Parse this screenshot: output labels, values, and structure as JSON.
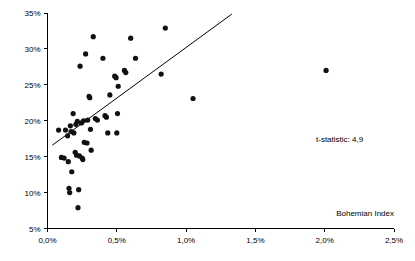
{
  "chart_data": {
    "type": "scatter",
    "title": "",
    "xlabel": "Bohemian Index",
    "ylabel": "",
    "xlim": [
      0.0,
      2.5
    ],
    "ylim": [
      5,
      35
    ],
    "grid": false,
    "legend": null,
    "x_tick_labels": [
      "0,0%",
      "0,5%",
      "1,0%",
      "1,5%",
      "2,0%",
      "2,5%"
    ],
    "x_tick_values": [
      0.0,
      0.5,
      1.0,
      1.5,
      2.0,
      2.5
    ],
    "y_tick_labels": [
      "5%",
      "10%",
      "15%",
      "20%",
      "25%",
      "30%",
      "35%"
    ],
    "y_tick_values": [
      5,
      10,
      15,
      20,
      25,
      30,
      35
    ],
    "annotations": [
      {
        "name": "t-statistic-annotation",
        "text": "t-statistic: 4,9",
        "x": 1.62,
        "y": 17.6
      }
    ],
    "trend_line": {
      "name": "regression-line",
      "x_start": 0.035,
      "y_start": 16.6,
      "x_end": 1.33,
      "y_end": 34.85
    },
    "point_radius_px": 2.6,
    "points": [
      {
        "x": 0.08,
        "y": 18.7
      },
      {
        "x": 0.1,
        "y": 14.9
      },
      {
        "x": 0.12,
        "y": 14.8
      },
      {
        "x": 0.13,
        "y": 18.7
      },
      {
        "x": 0.145,
        "y": 17.9
      },
      {
        "x": 0.15,
        "y": 14.3
      },
      {
        "x": 0.155,
        "y": 10.6
      },
      {
        "x": 0.16,
        "y": 10.0
      },
      {
        "x": 0.165,
        "y": 19.3
      },
      {
        "x": 0.17,
        "y": 18.5
      },
      {
        "x": 0.175,
        "y": 12.9
      },
      {
        "x": 0.185,
        "y": 21.0
      },
      {
        "x": 0.19,
        "y": 18.3
      },
      {
        "x": 0.2,
        "y": 15.6
      },
      {
        "x": 0.205,
        "y": 19.5
      },
      {
        "x": 0.21,
        "y": 15.2
      },
      {
        "x": 0.215,
        "y": 19.9
      },
      {
        "x": 0.22,
        "y": 7.9
      },
      {
        "x": 0.225,
        "y": 10.4
      },
      {
        "x": 0.23,
        "y": 15.1
      },
      {
        "x": 0.235,
        "y": 27.6
      },
      {
        "x": 0.245,
        "y": 19.7
      },
      {
        "x": 0.25,
        "y": 14.8
      },
      {
        "x": 0.255,
        "y": 14.6
      },
      {
        "x": 0.26,
        "y": 20.0
      },
      {
        "x": 0.265,
        "y": 17.0
      },
      {
        "x": 0.275,
        "y": 29.3
      },
      {
        "x": 0.285,
        "y": 16.9
      },
      {
        "x": 0.29,
        "y": 20.1
      },
      {
        "x": 0.3,
        "y": 23.4
      },
      {
        "x": 0.305,
        "y": 23.2
      },
      {
        "x": 0.31,
        "y": 18.8
      },
      {
        "x": 0.315,
        "y": 15.9
      },
      {
        "x": 0.33,
        "y": 31.7
      },
      {
        "x": 0.345,
        "y": 20.3
      },
      {
        "x": 0.36,
        "y": 20.1
      },
      {
        "x": 0.4,
        "y": 28.7
      },
      {
        "x": 0.415,
        "y": 20.7
      },
      {
        "x": 0.425,
        "y": 20.5
      },
      {
        "x": 0.435,
        "y": 18.3
      },
      {
        "x": 0.45,
        "y": 23.6
      },
      {
        "x": 0.485,
        "y": 26.2
      },
      {
        "x": 0.495,
        "y": 26.0
      },
      {
        "x": 0.5,
        "y": 18.3
      },
      {
        "x": 0.505,
        "y": 21.0
      },
      {
        "x": 0.51,
        "y": 24.8
      },
      {
        "x": 0.555,
        "y": 27.0
      },
      {
        "x": 0.565,
        "y": 26.7
      },
      {
        "x": 0.6,
        "y": 31.5
      },
      {
        "x": 0.635,
        "y": 28.7
      },
      {
        "x": 0.82,
        "y": 26.5
      },
      {
        "x": 0.85,
        "y": 32.9
      },
      {
        "x": 1.05,
        "y": 23.1
      },
      {
        "x": 2.01,
        "y": 27.0
      }
    ]
  }
}
